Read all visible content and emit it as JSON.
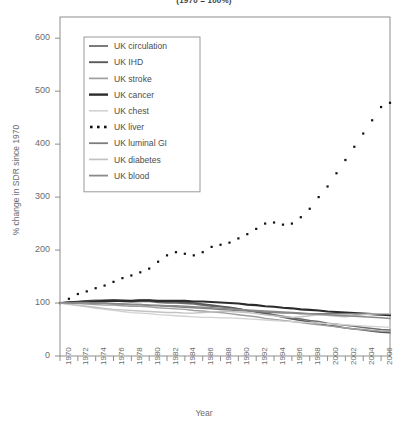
{
  "chart_data": {
    "type": "line",
    "title": "(1970 = 100%)",
    "xlabel": "Year",
    "ylabel": "% change in SDR since 1970",
    "xlim": [
      1970,
      2007
    ],
    "ylim": [
      0,
      640
    ],
    "yticks": [
      0,
      100,
      200,
      300,
      400,
      500,
      600
    ],
    "xticks": [
      1970,
      1972,
      1974,
      1976,
      1978,
      1980,
      1982,
      1984,
      1986,
      1988,
      1990,
      1992,
      1994,
      1996,
      1998,
      2000,
      2002,
      2004,
      2006
    ],
    "grid": false,
    "legend_position": "upper left",
    "x": [
      1970,
      1971,
      1972,
      1973,
      1974,
      1975,
      1976,
      1977,
      1978,
      1979,
      1980,
      1981,
      1982,
      1983,
      1984,
      1985,
      1986,
      1987,
      1988,
      1989,
      1990,
      1991,
      1992,
      1993,
      1994,
      1995,
      1996,
      1997,
      1998,
      1999,
      2000,
      2001,
      2002,
      2003,
      2004,
      2005,
      2006,
      2007
    ],
    "series": [
      {
        "name": "UK circulation",
        "style": "solid",
        "color": "#6e6e6e",
        "width": 1.5,
        "values": [
          100,
          101,
          102,
          103,
          103,
          103,
          104,
          103,
          102,
          103,
          103,
          101,
          100,
          100,
          99,
          98,
          96,
          94,
          93,
          91,
          89,
          86,
          84,
          81,
          78,
          75,
          72,
          70,
          67,
          65,
          62,
          60,
          58,
          56,
          54,
          52,
          50,
          49
        ]
      },
      {
        "name": "UK IHD",
        "style": "solid",
        "color": "#5a5a5a",
        "width": 1.6,
        "values": [
          100,
          102,
          103,
          104,
          105,
          105,
          106,
          105,
          104,
          105,
          105,
          103,
          102,
          102,
          101,
          100,
          98,
          96,
          94,
          92,
          89,
          86,
          83,
          80,
          77,
          73,
          70,
          67,
          64,
          61,
          58,
          56,
          53,
          51,
          49,
          47,
          45,
          44
        ]
      },
      {
        "name": "UK stroke",
        "style": "solid",
        "color": "#9e9e9e",
        "width": 1.4,
        "values": [
          100,
          99,
          99,
          98,
          97,
          96,
          96,
          95,
          94,
          94,
          93,
          91,
          90,
          89,
          88,
          86,
          85,
          83,
          82,
          80,
          78,
          76,
          74,
          71,
          69,
          67,
          65,
          63,
          61,
          59,
          57,
          55,
          53,
          51,
          50,
          48,
          47,
          46
        ]
      },
      {
        "name": "UK cancer",
        "style": "solid",
        "color": "#2b2b2b",
        "width": 2.1,
        "values": [
          100,
          101,
          102,
          103,
          103,
          104,
          104,
          104,
          104,
          105,
          105,
          104,
          104,
          104,
          104,
          103,
          103,
          102,
          101,
          100,
          99,
          97,
          96,
          94,
          93,
          91,
          90,
          88,
          87,
          86,
          84,
          83,
          82,
          81,
          80,
          79,
          78,
          77
        ]
      },
      {
        "name": "UK chest",
        "style": "solid",
        "color": "#d2d2d2",
        "width": 1.3,
        "values": [
          100,
          97,
          95,
          93,
          90,
          88,
          86,
          84,
          82,
          81,
          80,
          78,
          77,
          76,
          75,
          74,
          73,
          73,
          72,
          72,
          71,
          70,
          69,
          68,
          67,
          66,
          65,
          64,
          63,
          62,
          61,
          60,
          59,
          58,
          57,
          56,
          55,
          54
        ]
      },
      {
        "name": "UK liver",
        "style": "dotted",
        "color": "#111111",
        "width": 2.4,
        "values": [
          100,
          108,
          117,
          122,
          128,
          133,
          140,
          147,
          152,
          158,
          165,
          178,
          190,
          196,
          193,
          190,
          196,
          206,
          210,
          214,
          222,
          230,
          240,
          250,
          252,
          248,
          250,
          262,
          278,
          300,
          320,
          345,
          370,
          395,
          420,
          445,
          470,
          478
        ]
      },
      {
        "name": "UK luminal GI",
        "style": "solid",
        "color": "#7d7d7d",
        "width": 1.5,
        "values": [
          100,
          100,
          101,
          101,
          100,
          100,
          99,
          98,
          97,
          97,
          96,
          95,
          94,
          93,
          92,
          91,
          90,
          89,
          88,
          87,
          86,
          85,
          84,
          83,
          82,
          81,
          81,
          80,
          80,
          80,
          80,
          80,
          80,
          80,
          80,
          80,
          80,
          80
        ]
      },
      {
        "name": "UK diabetes",
        "style": "solid",
        "color": "#c2c2c2",
        "width": 1.4,
        "values": [
          100,
          98,
          96,
          94,
          92,
          90,
          88,
          87,
          86,
          85,
          84,
          83,
          82,
          82,
          81,
          81,
          82,
          83,
          84,
          84,
          83,
          82,
          80,
          78,
          76,
          74,
          73,
          74,
          76,
          78,
          77,
          75,
          74,
          76,
          78,
          79,
          80,
          80
        ]
      },
      {
        "name": "UK blood",
        "style": "solid",
        "color": "#8a8a8a",
        "width": 1.5,
        "values": [
          100,
          100,
          100,
          100,
          99,
          99,
          98,
          98,
          97,
          97,
          96,
          96,
          95,
          95,
          94,
          93,
          92,
          91,
          90,
          89,
          88,
          87,
          86,
          85,
          84,
          83,
          82,
          81,
          80,
          79,
          78,
          77,
          76,
          75,
          74,
          73,
          72,
          71
        ]
      }
    ]
  },
  "legend": {
    "entries": [
      {
        "label": "UK circulation"
      },
      {
        "label": "UK IHD"
      },
      {
        "label": "UK stroke"
      },
      {
        "label": "UK cancer"
      },
      {
        "label": "UK chest"
      },
      {
        "label": "UK liver"
      },
      {
        "label": "UK luminal GI"
      },
      {
        "label": "UK diabetes"
      },
      {
        "label": "UK blood"
      }
    ]
  },
  "axis": {
    "y_tick_labels": [
      "600",
      "500",
      "400",
      "300",
      "200",
      "100",
      "0"
    ],
    "x_tick_labels": [
      "1970",
      "1972",
      "1974",
      "1976",
      "1978",
      "1980",
      "1982",
      "1984",
      "1986",
      "1988",
      "1990",
      "1992",
      "1994",
      "1996",
      "1998",
      "2000",
      "2002",
      "2004",
      "2006"
    ]
  }
}
